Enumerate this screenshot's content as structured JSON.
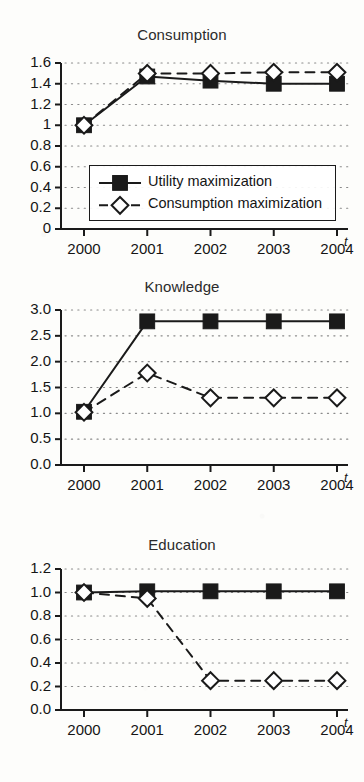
{
  "figure": {
    "background": "#fdfdfb",
    "ink": "#1a1a1a",
    "grid_color": "#8a8a8a",
    "series_names": [
      "Utility maximization",
      "Consumption maximization"
    ]
  },
  "legend": {
    "entry1_label": "Utility maximization",
    "entry1_marker": "filled-square-icon",
    "entry1_line": "solid",
    "entry2_label": "Consumption maximization",
    "entry2_marker": "open-diamond-icon",
    "entry2_line": "dashed"
  },
  "chart_data": [
    {
      "type": "line",
      "title": "Consumption",
      "xlabel": "t",
      "ylabel": "",
      "grid": true,
      "legend_position": "lower-center-inside",
      "x": [
        2000,
        2001,
        2002,
        2003,
        2004
      ],
      "xtick_labels": [
        "2000",
        "2001",
        "2002",
        "2003",
        "2004"
      ],
      "ytick_labels": [
        "0",
        "0.2",
        "0.4",
        "0.6",
        "0.8",
        "1",
        "1.2",
        "1.4",
        "1.6"
      ],
      "ytick_values": [
        0,
        0.2,
        0.4,
        0.6,
        0.8,
        1.0,
        1.2,
        1.4,
        1.6
      ],
      "ylim": [
        0,
        1.6
      ],
      "series": [
        {
          "name": "Utility maximization",
          "values": [
            1.0,
            1.47,
            1.43,
            1.4,
            1.4
          ],
          "marker": "filled-square",
          "line": "solid"
        },
        {
          "name": "Consumption maximization",
          "values": [
            1.0,
            1.5,
            1.5,
            1.51,
            1.51
          ],
          "marker": "open-diamond",
          "line": "dashed"
        }
      ]
    },
    {
      "type": "line",
      "title": "Knowledge",
      "xlabel": "t",
      "ylabel": "",
      "grid": true,
      "legend_position": "none",
      "x": [
        2000,
        2001,
        2002,
        2003,
        2004
      ],
      "xtick_labels": [
        "2000",
        "2001",
        "2002",
        "2003",
        "2004"
      ],
      "ytick_labels": [
        "0.0",
        "0.5",
        "1.0",
        "1.5",
        "2.0",
        "2.5",
        "3.0"
      ],
      "ytick_values": [
        0.0,
        0.5,
        1.0,
        1.5,
        2.0,
        2.5,
        3.0
      ],
      "ylim": [
        0,
        3.0
      ],
      "series": [
        {
          "name": "Utility maximization",
          "values": [
            1.03,
            2.78,
            2.78,
            2.78,
            2.78
          ],
          "marker": "filled-square",
          "line": "solid"
        },
        {
          "name": "Consumption maximization",
          "values": [
            1.02,
            1.78,
            1.3,
            1.3,
            1.3
          ],
          "marker": "open-diamond",
          "line": "dashed"
        }
      ]
    },
    {
      "type": "line",
      "title": "Education",
      "xlabel": "t",
      "ylabel": "",
      "grid": true,
      "legend_position": "none",
      "x": [
        2000,
        2001,
        2002,
        2003,
        2004
      ],
      "xtick_labels": [
        "2000",
        "2001",
        "2002",
        "2003",
        "2004"
      ],
      "ytick_labels": [
        "0.0",
        "0.2",
        "0.4",
        "0.6",
        "0.8",
        "1.0",
        "1.2"
      ],
      "ytick_values": [
        0.0,
        0.2,
        0.4,
        0.6,
        0.8,
        1.0,
        1.2
      ],
      "ylim": [
        0,
        1.2
      ],
      "series": [
        {
          "name": "Utility maximization",
          "values": [
            1.0,
            1.01,
            1.01,
            1.01,
            1.01
          ],
          "marker": "filled-square",
          "line": "solid"
        },
        {
          "name": "Consumption maximization",
          "values": [
            1.0,
            0.95,
            0.25,
            0.25,
            0.25
          ],
          "marker": "open-diamond",
          "line": "dashed"
        }
      ]
    }
  ]
}
